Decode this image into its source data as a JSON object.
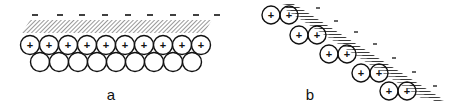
{
  "figure": {
    "panels": [
      {
        "id": "a",
        "label": "a",
        "description": "Flat surface: layer of negative charges above a hatched layer, with a row of positively charged spheres on top of a row of neutral spheres",
        "negative_charges": 9,
        "positive_spheres": 10,
        "neutral_spheres": 9,
        "negative_symbol": "–",
        "positive_symbol": "+"
      },
      {
        "id": "b",
        "label": "b",
        "description": "Tilted (stepped) surface: pairs of positively charged spheres arranged along a diagonal hatched layer with negative charges on the outer side",
        "positive_sphere_pairs": 5,
        "negative_charges": 7,
        "negative_symbol": "-",
        "positive_symbol": "+"
      }
    ],
    "colors": {
      "stroke": "#111111",
      "background": "#ffffff",
      "hatch": "#333333"
    }
  }
}
